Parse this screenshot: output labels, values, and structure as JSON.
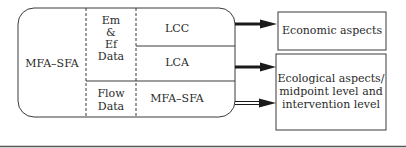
{
  "diagram": {
    "source_block": {
      "label": "MFA–SFA",
      "data_column": {
        "em_ef": [
          "Em",
          "&",
          "Ef",
          "Data"
        ],
        "flow": [
          "Flow",
          "Data"
        ]
      },
      "methods": {
        "lcc": "LCC",
        "lca": "LCA",
        "mfa_sfa": "MFA–SFA"
      }
    },
    "outputs": {
      "economic": "Economic aspects",
      "ecological": [
        "Ecological aspects/",
        "midpoint level and",
        "intervention level"
      ]
    },
    "colors": {
      "line": "#2a2a2a",
      "arrow": "#1a1a1a",
      "background": "#ffffff"
    }
  }
}
